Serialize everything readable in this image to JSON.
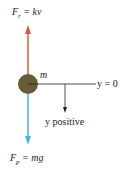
{
  "diagram": {
    "labels": {
      "resistance_force_symbol": "F",
      "resistance_force_sub": "r",
      "resistance_force_eq": " = kv",
      "mass": "m",
      "origin": "y = 0",
      "direction": "y positive",
      "gravity_force_symbol": "F",
      "gravity_force_sub": "p",
      "gravity_force_eq": " = mg"
    },
    "colors": {
      "resistance_arrow": "#e0583a",
      "gravity_arrow": "#4ab3de",
      "mass": "#6b5a3a",
      "lines": "#222222"
    }
  }
}
